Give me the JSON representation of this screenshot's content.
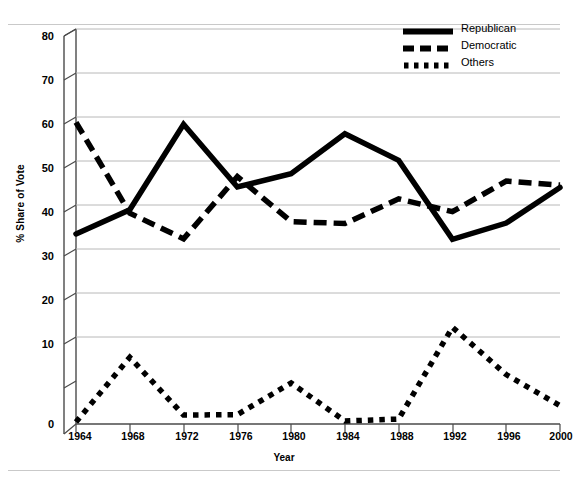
{
  "chart_data": {
    "type": "line",
    "title": "",
    "subtitle": "",
    "xlabel": "Year",
    "ylabel": "% Share of Vote",
    "categories": [
      "1964",
      "1968",
      "1972",
      "1976",
      "1980",
      "1984",
      "1988",
      "1992",
      "1996",
      "2000"
    ],
    "xlim": [
      "1964",
      "2000"
    ],
    "ylim": [
      0,
      80
    ],
    "yticks": [
      0,
      10,
      20,
      30,
      40,
      50,
      60,
      70,
      80
    ],
    "grid": "horizontal",
    "legend_position": "top-right",
    "series": [
      {
        "name": "Republican",
        "style": "solid",
        "color": "#000000",
        "values": [
          38.5,
          43.4,
          60.7,
          48.0,
          50.7,
          58.8,
          53.4,
          37.4,
          40.7,
          47.9
        ]
      },
      {
        "name": "Democratic",
        "style": "dashed",
        "color": "#000000",
        "values": [
          61.1,
          42.7,
          37.5,
          50.1,
          41.0,
          40.6,
          45.6,
          43.0,
          49.2,
          48.4
        ]
      },
      {
        "name": "Others",
        "style": "dotted",
        "color": "#000000",
        "values": [
          0.4,
          13.5,
          1.8,
          1.9,
          8.3,
          0.6,
          1.0,
          19.6,
          10.0,
          3.7
        ]
      }
    ]
  },
  "legend": {
    "items": [
      {
        "label": "Republican",
        "swatch": "solid-line-swatch"
      },
      {
        "label": "Democratic",
        "swatch": "dashed-line-swatch"
      },
      {
        "label": "Others",
        "swatch": "dotted-line-swatch"
      }
    ]
  },
  "axis": {
    "y_label": "% Share of Vote",
    "x_label": "Year",
    "y_ticks": [
      "80",
      "70",
      "60",
      "50",
      "40",
      "30",
      "20",
      "10",
      "0"
    ],
    "x_ticks": [
      "1964",
      "1968",
      "1972",
      "1976",
      "1980",
      "1984",
      "1988",
      "1992",
      "1996",
      "2000"
    ]
  }
}
